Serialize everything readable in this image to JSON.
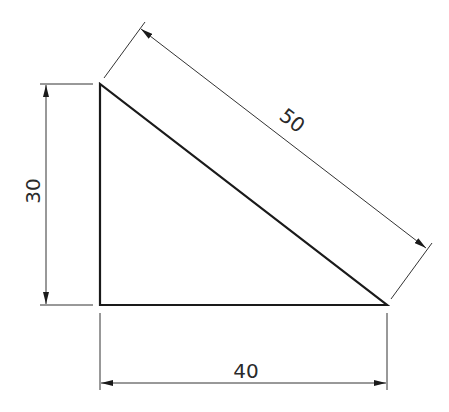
{
  "diagram": {
    "type": "right-triangle-dimensioned",
    "colors": {
      "background": "#ffffff",
      "outline": "#1a1a1a",
      "dimension_lines": "#333333",
      "text": "#2a2a2a"
    },
    "triangle": {
      "vertices": [
        [
          100,
          84
        ],
        [
          100,
          305
        ],
        [
          387,
          305
        ]
      ]
    },
    "dimensions": {
      "height": {
        "label": "30"
      },
      "base": {
        "label": "40"
      },
      "hypotenuse": {
        "label": "50"
      }
    }
  }
}
